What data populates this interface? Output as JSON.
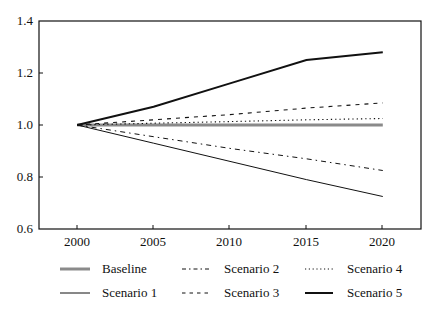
{
  "chart_data": {
    "type": "line",
    "title": "",
    "xlabel": "",
    "ylabel": "",
    "x": [
      2000,
      2005,
      2010,
      2015,
      2020
    ],
    "xticks": [
      "2000",
      "2005",
      "2010",
      "2015",
      "2020"
    ],
    "yticks": [
      "0.6",
      "0.8",
      "1.0",
      "1.2",
      "1.4"
    ],
    "xlim": [
      1997.5,
      2022.5
    ],
    "ylim": [
      0.6,
      1.4
    ],
    "grid": false,
    "legend_position": "bottom",
    "series": [
      {
        "name": "Baseline",
        "values": [
          1.0,
          1.0,
          1.0,
          1.0,
          1.0
        ],
        "style": "solid-thick-gray"
      },
      {
        "name": "Scenario 1",
        "values": [
          1.0,
          0.93,
          0.86,
          0.79,
          0.725
        ],
        "style": "solid-thin"
      },
      {
        "name": "Scenario 2",
        "values": [
          1.0,
          0.955,
          0.91,
          0.87,
          0.825
        ],
        "style": "dash-dot"
      },
      {
        "name": "Scenario 3",
        "values": [
          1.0,
          1.02,
          1.04,
          1.065,
          1.085
        ],
        "style": "dashed"
      },
      {
        "name": "Scenario 4",
        "values": [
          1.0,
          1.007,
          1.013,
          1.02,
          1.025
        ],
        "style": "dotted"
      },
      {
        "name": "Scenario 5",
        "values": [
          1.0,
          1.07,
          1.16,
          1.25,
          1.28
        ],
        "style": "solid-thick"
      }
    ]
  },
  "legend": {
    "items": [
      {
        "label": "Baseline"
      },
      {
        "label": "Scenario 1"
      },
      {
        "label": "Scenario 2"
      },
      {
        "label": "Scenario 3"
      },
      {
        "label": "Scenario 4"
      },
      {
        "label": "Scenario 5"
      }
    ]
  },
  "colors": {
    "axis": "#111111",
    "baseline": "#8a8a8a",
    "line": "#111111"
  }
}
